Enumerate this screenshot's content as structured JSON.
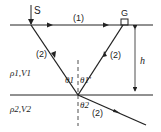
{
  "diagram": {
    "type": "seismic reflection/refraction schematic",
    "labels": {
      "source": "S",
      "geophone": "G",
      "direct_ray": "(1)",
      "reflected_down": "(2)",
      "reflected_up": "(2)",
      "refracted": "(2)",
      "thickness": "h",
      "layer1": "ρ1,V1",
      "layer2": "ρ2,V2",
      "angle_incident": "θ1",
      "angle_reflected": "θ1'",
      "angle_refracted": "θ2"
    },
    "colors": {
      "line": "#222222",
      "background": "#ffffff"
    }
  }
}
